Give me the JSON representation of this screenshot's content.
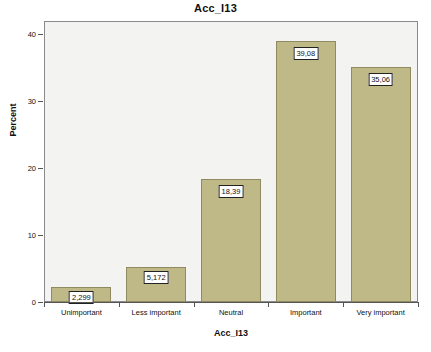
{
  "chart_data": {
    "type": "bar",
    "title": "Acc_I13",
    "xlabel": "Acc_I13",
    "ylabel": "Percent",
    "categories": [
      "Unimportant",
      "Less important",
      "Neutral",
      "Important",
      "Very important"
    ],
    "values": [
      2.299,
      5.172,
      18.39,
      39.08,
      35.06
    ],
    "value_labels": [
      "2,299",
      "5,172",
      "18,39",
      "39,08",
      "35,06"
    ],
    "ylim": [
      0,
      42
    ],
    "yticks": [
      0,
      10,
      20,
      30,
      40
    ],
    "ytick_labels": [
      "0",
      "10",
      "20",
      "30",
      "40"
    ],
    "grid": false,
    "legend": "none",
    "colors": {
      "bar_fill": "#bfb988",
      "bar_border": "#8f8a5f",
      "plot_background": "#f3f3f2",
      "plot_border": "#8a8a8a",
      "axis": "#555555",
      "text": "#111111",
      "label_box_background": "#ffffff",
      "label_box_border": "#222222"
    }
  }
}
